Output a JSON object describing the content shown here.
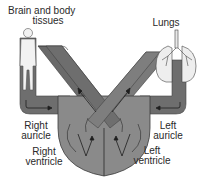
{
  "diagram": {
    "colors": {
      "vessel": "#6e6e6e",
      "vessel_dark": "#555555",
      "heart": "#8a8a8a",
      "heart_outline": "#3a3a3a",
      "arrow": "#1e1e1e",
      "body_fill": "#f2f2f2",
      "lungs_fill": "#eeeeee"
    },
    "labels": {
      "brain_line1": "Brain and body",
      "brain_line2": "tissues",
      "lungs": "Lungs",
      "right_auricle_line1": "Right",
      "right_auricle_line2": "auricle",
      "right_ventricle_line1": "Right",
      "right_ventricle_line2": "ventricle",
      "left_auricle_line1": "Left",
      "left_auricle_line2": "auricle",
      "left_ventricle_line1": "Left",
      "left_ventricle_line2": "ventricle"
    },
    "nodes": [
      {
        "id": "body",
        "label": "Brain and body tissues",
        "icon": "human-figure-icon"
      },
      {
        "id": "lungs",
        "label": "Lungs",
        "icon": "lungs-icon"
      },
      {
        "id": "right_auricle",
        "label": "Right auricle"
      },
      {
        "id": "right_ventricle",
        "label": "Right ventricle"
      },
      {
        "id": "left_auricle",
        "label": "Left auricle"
      },
      {
        "id": "left_ventricle",
        "label": "Left ventricle"
      }
    ],
    "edges": [
      {
        "from": "body",
        "to": "right_auricle"
      },
      {
        "from": "right_auricle",
        "to": "right_ventricle"
      },
      {
        "from": "right_ventricle",
        "to": "lungs"
      },
      {
        "from": "lungs",
        "to": "left_auricle"
      },
      {
        "from": "left_auricle",
        "to": "left_ventricle"
      },
      {
        "from": "left_ventricle",
        "to": "body"
      }
    ]
  }
}
